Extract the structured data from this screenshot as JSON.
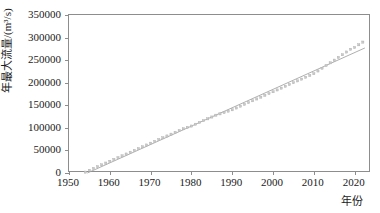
{
  "chart_data": {
    "type": "scatter",
    "title": "",
    "xlabel": "年份",
    "ylabel": "年最大流量/(m³/s)",
    "xlim": [
      1950,
      2024
    ],
    "ylim": [
      0,
      350000
    ],
    "xticks": [
      1950,
      1960,
      1970,
      1980,
      1990,
      2000,
      2010,
      2020
    ],
    "yticks": [
      0,
      50000,
      100000,
      150000,
      200000,
      250000,
      300000,
      350000
    ],
    "grid": false,
    "legend": null,
    "marker_color": "#c9c9c9",
    "trend_color": "#9a9a9a",
    "axis_color": "#8d8d8d",
    "series": [
      {
        "name": "年最大流量",
        "x": [
          1954,
          1955,
          1956,
          1957,
          1958,
          1959,
          1960,
          1961,
          1962,
          1963,
          1964,
          1965,
          1966,
          1967,
          1968,
          1969,
          1970,
          1971,
          1972,
          1973,
          1974,
          1975,
          1976,
          1977,
          1978,
          1979,
          1980,
          1981,
          1982,
          1983,
          1984,
          1985,
          1986,
          1987,
          1988,
          1989,
          1990,
          1991,
          1992,
          1993,
          1994,
          1995,
          1996,
          1997,
          1998,
          1999,
          2000,
          2001,
          2002,
          2003,
          2004,
          2005,
          2006,
          2007,
          2008,
          2009,
          2010,
          2011,
          2012,
          2013,
          2014,
          2015,
          2016,
          2017,
          2018,
          2019,
          2020,
          2021,
          2022
        ],
        "y": [
          2000,
          6000,
          10000,
          14000,
          18000,
          22000,
          26000,
          30000,
          34000,
          38000,
          42000,
          46000,
          50000,
          54000,
          58000,
          62000,
          66000,
          70000,
          74000,
          78000,
          82000,
          86000,
          90000,
          94000,
          98000,
          101000,
          104000,
          108000,
          112000,
          116000,
          120000,
          124000,
          128000,
          131000,
          134000,
          137000,
          140000,
          144000,
          148000,
          152000,
          156000,
          160000,
          164000,
          168000,
          172000,
          176000,
          180000,
          184000,
          188000,
          192000,
          196000,
          200000,
          204000,
          208000,
          212000,
          216000,
          220000,
          226000,
          232000,
          238000,
          244000,
          250000,
          256000,
          262000,
          268000,
          274000,
          278000,
          284000,
          290000
        ]
      }
    ],
    "trendline": {
      "name": "线性趋势线",
      "x": [
        1954.5,
        2022.5
      ],
      "y": [
        0,
        277000
      ]
    }
  }
}
